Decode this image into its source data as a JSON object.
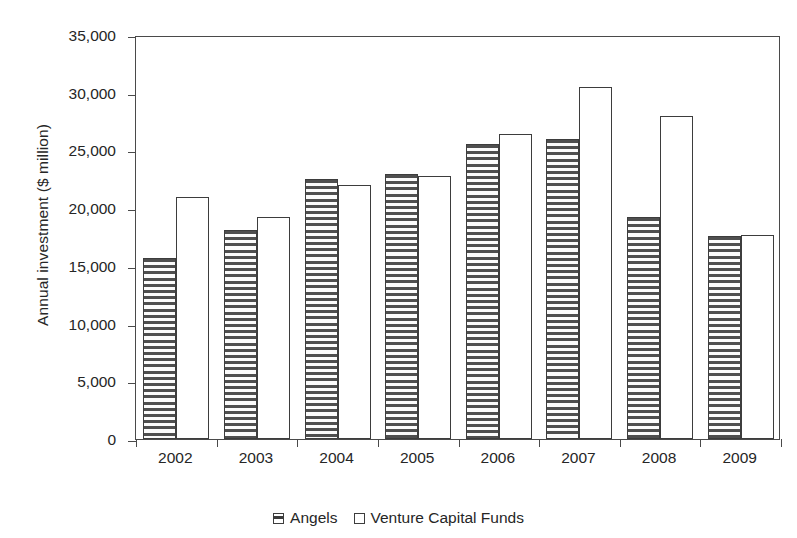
{
  "chart_data": {
    "type": "bar",
    "title": "",
    "xlabel": "",
    "ylabel": "Annual investment ($ million)",
    "categories": [
      "2002",
      "2003",
      "2004",
      "2005",
      "2006",
      "2007",
      "2008",
      "2009"
    ],
    "series": [
      {
        "name": "Angels",
        "values": [
          15700,
          18100,
          22500,
          23000,
          25600,
          26000,
          19200,
          17600
        ],
        "pattern": "horizontal-stripes",
        "color": "#4f4f4f"
      },
      {
        "name": "Venture Capital Funds",
        "values": [
          21000,
          19200,
          22000,
          22800,
          26400,
          30500,
          28000,
          17700
        ],
        "pattern": "empty",
        "color": "#ffffff"
      }
    ],
    "ylim": [
      0,
      35000
    ],
    "yticks": [
      0,
      5000,
      10000,
      15000,
      20000,
      25000,
      30000,
      35000
    ],
    "ytick_labels": [
      "0",
      "5,000",
      "10,000",
      "15,000",
      "20,000",
      "25,000",
      "30,000",
      "35,000"
    ],
    "grid": false,
    "legend_position": "bottom-center",
    "legend": [
      {
        "label": "Angels",
        "marker": "hatched-square"
      },
      {
        "label": "Venture Capital Funds",
        "marker": "empty-square"
      }
    ],
    "axis_color": "#4a4a4a",
    "text_color": "#262626",
    "background": "#ffffff"
  }
}
